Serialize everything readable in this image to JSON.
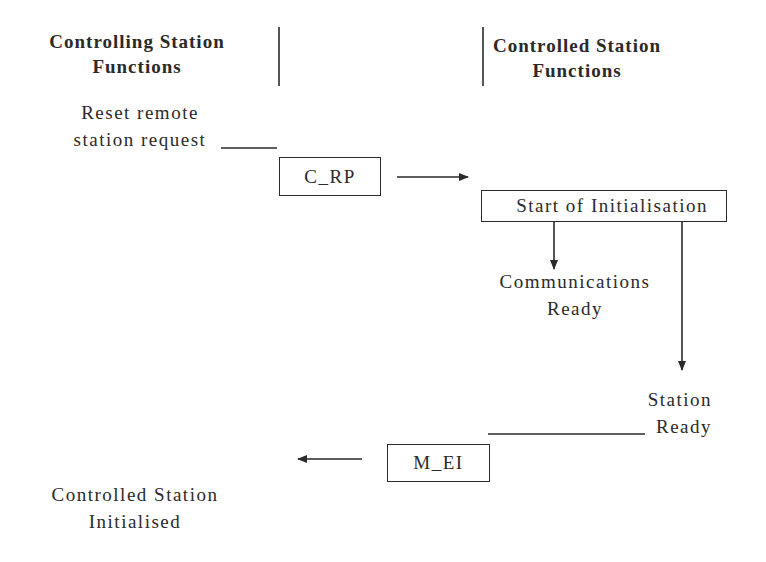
{
  "headers": {
    "controlling": {
      "line1": "Controlling Station",
      "line2": "Functions"
    },
    "controlled": {
      "line1": "Controlled Station",
      "line2": "Functions"
    }
  },
  "steps": {
    "reset_request": {
      "line1": "Reset remote",
      "line2": "station request"
    },
    "c_rp_box": "C_RP",
    "start_init_box": "Start of Initialisation",
    "comms_ready": {
      "line1": "Communications",
      "line2": "Ready"
    },
    "station_ready": {
      "line1": "Station",
      "line2": "Ready"
    },
    "m_ei_box": "M_EI",
    "initialised": {
      "line1": "Controlled Station",
      "line2": "Initialised"
    }
  },
  "colors": {
    "ink": "#2a2a2a",
    "background": "#ffffff"
  }
}
